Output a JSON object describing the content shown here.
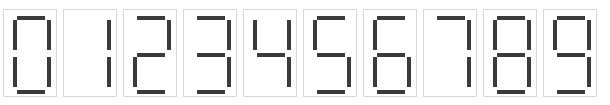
{
  "display": {
    "type": "seven-segment-digit-strip",
    "description": "Row of ten seven-segment display cells showing digits 0 through 9",
    "digit_count": 10,
    "sequence": "0123456789",
    "segment_labels": [
      "a",
      "b",
      "c",
      "d",
      "e",
      "f",
      "g"
    ],
    "colors": {
      "background": "#ffffff",
      "segment_on": "#3b3b3b",
      "segment_off": "#ffffff",
      "cell_border": "#d8d8d8"
    },
    "cells": [
      {
        "value": "0",
        "label": "digit-zero",
        "segments": {
          "a": true,
          "b": true,
          "c": true,
          "d": true,
          "e": true,
          "f": true,
          "g": false
        }
      },
      {
        "value": "1",
        "label": "digit-one",
        "segments": {
          "a": false,
          "b": true,
          "c": true,
          "d": false,
          "e": false,
          "f": false,
          "g": false
        }
      },
      {
        "value": "2",
        "label": "digit-two",
        "segments": {
          "a": true,
          "b": true,
          "c": false,
          "d": true,
          "e": true,
          "f": false,
          "g": true
        }
      },
      {
        "value": "3",
        "label": "digit-three",
        "segments": {
          "a": true,
          "b": true,
          "c": true,
          "d": true,
          "e": false,
          "f": false,
          "g": true
        }
      },
      {
        "value": "4",
        "label": "digit-four",
        "segments": {
          "a": false,
          "b": true,
          "c": true,
          "d": false,
          "e": false,
          "f": true,
          "g": true
        }
      },
      {
        "value": "5",
        "label": "digit-five",
        "segments": {
          "a": true,
          "b": false,
          "c": true,
          "d": true,
          "e": false,
          "f": true,
          "g": true
        }
      },
      {
        "value": "6",
        "label": "digit-six",
        "segments": {
          "a": true,
          "b": false,
          "c": true,
          "d": true,
          "e": true,
          "f": true,
          "g": true
        }
      },
      {
        "value": "7",
        "label": "digit-seven",
        "segments": {
          "a": true,
          "b": true,
          "c": true,
          "d": false,
          "e": false,
          "f": false,
          "g": false
        }
      },
      {
        "value": "8",
        "label": "digit-eight",
        "segments": {
          "a": true,
          "b": true,
          "c": true,
          "d": true,
          "e": true,
          "f": true,
          "g": true
        }
      },
      {
        "value": "9",
        "label": "digit-nine",
        "segments": {
          "a": true,
          "b": true,
          "c": true,
          "d": true,
          "e": false,
          "f": true,
          "g": true
        }
      }
    ]
  }
}
